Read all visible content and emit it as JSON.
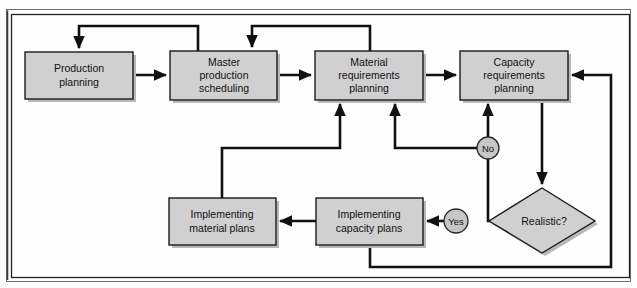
{
  "diagram": {
    "colors": {
      "node_fill": "#d0d0d0",
      "circle_fill": "#c6c6c6",
      "stroke": "#111111",
      "frame": "#3a3a3a",
      "background": "#fefefe"
    },
    "nodes": [
      {
        "id": "production-planning",
        "shape": "rect",
        "label": "Production\nplanning",
        "lines": [
          "Production",
          "planning"
        ],
        "x": 25,
        "y": 52,
        "w": 108,
        "h": 47
      },
      {
        "id": "master-production-scheduling",
        "shape": "rect",
        "label": "Master\nproduction\nscheduling",
        "lines": [
          "Master",
          "production",
          "scheduling"
        ],
        "x": 170,
        "y": 51,
        "w": 107,
        "h": 49
      },
      {
        "id": "material-requirements-planning",
        "shape": "rect",
        "label": "Material\nrequirements\nplanning",
        "lines": [
          "Material",
          "requirements",
          "planning"
        ],
        "x": 315,
        "y": 51,
        "w": 108,
        "h": 49
      },
      {
        "id": "capacity-requirements-planning",
        "shape": "rect",
        "label": "Capacity\nrequirements\nplanning",
        "lines": [
          "Capacity",
          "requirements",
          "planning"
        ],
        "x": 460,
        "y": 51,
        "w": 108,
        "h": 49
      },
      {
        "id": "implementing-material-plans",
        "shape": "rect",
        "label": "Implementing\nmaterial plans",
        "lines": [
          "Implementing",
          "material plans"
        ],
        "x": 169,
        "y": 198,
        "w": 107,
        "h": 47
      },
      {
        "id": "implementing-capacity-plans",
        "shape": "rect",
        "label": "Implementing\ncapacity plans",
        "lines": [
          "Implementing",
          "capacity plans"
        ],
        "x": 316,
        "y": 198,
        "w": 107,
        "h": 47
      },
      {
        "id": "realistic-decision",
        "shape": "diamond",
        "label": "Realistic?",
        "lines": [
          "Realistic?"
        ],
        "cx": 542,
        "cy": 221,
        "rx": 53,
        "ry": 33
      },
      {
        "id": "no-branch",
        "shape": "circle",
        "label": "No",
        "cx": 488,
        "cy": 148,
        "r": 11
      },
      {
        "id": "yes-branch",
        "shape": "circle",
        "label": "Yes",
        "cx": 456,
        "cy": 221,
        "r": 12
      }
    ],
    "edges": [
      {
        "id": "production-to-master",
        "from": "production-planning",
        "to": "master-production-scheduling",
        "label": ""
      },
      {
        "id": "master-to-material",
        "from": "master-production-scheduling",
        "to": "material-requirements-planning",
        "label": ""
      },
      {
        "id": "material-to-capacity",
        "from": "material-requirements-planning",
        "to": "capacity-requirements-planning",
        "label": ""
      },
      {
        "id": "master-feedback-to-production",
        "from": "master-production-scheduling",
        "to": "production-planning",
        "label": ""
      },
      {
        "id": "material-feedback-to-master",
        "from": "material-requirements-planning",
        "to": "master-production-scheduling",
        "label": ""
      },
      {
        "id": "capacity-to-realistic",
        "from": "capacity-requirements-planning",
        "to": "realistic-decision",
        "label": ""
      },
      {
        "id": "realistic-no-to-capacity",
        "from": "realistic-decision",
        "to": "capacity-requirements-planning",
        "label": "No"
      },
      {
        "id": "no-to-material",
        "from": "no-branch",
        "to": "material-requirements-planning",
        "label": ""
      },
      {
        "id": "realistic-yes-to-implementing-capacity",
        "from": "realistic-decision",
        "to": "implementing-capacity-plans",
        "label": "Yes"
      },
      {
        "id": "implementing-capacity-to-implementing-material",
        "from": "implementing-capacity-plans",
        "to": "implementing-material-plans",
        "label": ""
      },
      {
        "id": "implementing-material-to-material",
        "from": "implementing-material-plans",
        "to": "material-requirements-planning",
        "label": ""
      },
      {
        "id": "implementing-capacity-to-capacity",
        "from": "implementing-capacity-plans",
        "to": "capacity-requirements-planning",
        "label": ""
      }
    ]
  }
}
